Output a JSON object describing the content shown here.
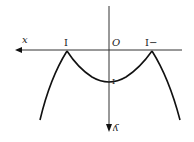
{
  "diagram": {
    "type": "function-graph",
    "note": "rendered rotated 180 degrees (mirrored labels)",
    "labels": {
      "x_axis": "x",
      "y_axis": "ʎ",
      "origin": "O",
      "left_tick": "I",
      "right_tick": "I−",
      "y_intercept": "I"
    },
    "colors": {
      "stroke": "#111111",
      "axis": "#333333",
      "background": "#ffffff"
    },
    "points": {
      "left_cusp": [
        67,
        51
      ],
      "right_cusp": [
        152,
        51
      ],
      "vertex": [
        109,
        83
      ]
    }
  }
}
